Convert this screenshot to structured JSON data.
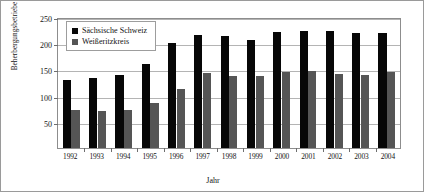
{
  "figure": {
    "border_color": "#9a9a9a",
    "background": "#ffffff"
  },
  "legend": {
    "position": "inside-top-left",
    "entries": [
      {
        "label": "Sächsische Schweiz",
        "color": "#070707"
      },
      {
        "label": "Weißeritzkreis",
        "color": "#555555"
      }
    ]
  },
  "chart_data": {
    "type": "bar",
    "title": "",
    "subtitle": "",
    "xlabel": "Jahr",
    "ylabel": "Beherbergungsbetriebe",
    "categories": [
      "1992",
      "1993",
      "1994",
      "1995",
      "1996",
      "1997",
      "1998",
      "1999",
      "2000",
      "2001",
      "2002",
      "2003",
      "2004"
    ],
    "series": [
      {
        "name": "Sächsische Schweiz",
        "color": "#070707",
        "values": [
          130,
          133,
          140,
          161,
          200,
          215,
          213,
          207,
          221,
          224,
          224,
          219,
          219
        ]
      },
      {
        "name": "Weißeritzkreis",
        "color": "#555555",
        "values": [
          72,
          71,
          72,
          85,
          113,
          143,
          138,
          137,
          146,
          147,
          142,
          140,
          145
        ]
      }
    ],
    "ylim": [
      0,
      250
    ],
    "yticks": [
      50,
      100,
      150,
      200,
      250
    ],
    "ytick_labels": [
      "50",
      "100",
      "150",
      "200",
      "250"
    ],
    "grid": true,
    "grid_axis": "y",
    "legend_position": "upper left inside"
  }
}
